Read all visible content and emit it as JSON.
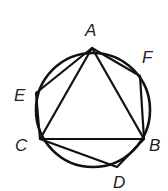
{
  "figure": {
    "circle": {
      "cx": 93,
      "cy": 110,
      "r": 57
    },
    "points": {
      "A": {
        "x": 92,
        "y": 48
      },
      "F": {
        "x": 140,
        "y": 76
      },
      "B": {
        "x": 144,
        "y": 139
      },
      "D": {
        "x": 117,
        "y": 167
      },
      "C": {
        "x": 40,
        "y": 139
      },
      "E": {
        "x": 36,
        "y": 93
      }
    },
    "labels": [
      {
        "id": "A",
        "text": "A",
        "x": 85,
        "y": 36
      },
      {
        "id": "F",
        "text": "F",
        "x": 142,
        "y": 63
      },
      {
        "id": "B",
        "text": "B",
        "x": 149,
        "y": 151
      },
      {
        "id": "D",
        "text": "D",
        "x": 113,
        "y": 188
      },
      {
        "id": "E",
        "text": "E",
        "x": 14,
        "y": 101
      },
      {
        "id": "C",
        "text": "C",
        "x": 15,
        "y": 151
      }
    ],
    "triangle": [
      "A",
      "B",
      "C"
    ],
    "hexagon": [
      "A",
      "F",
      "B",
      "D",
      "C",
      "E"
    ]
  }
}
